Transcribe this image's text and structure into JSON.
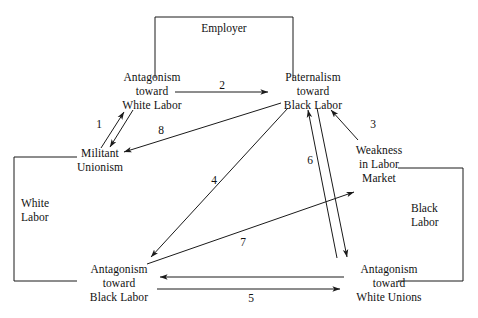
{
  "figure": {
    "type": "flow-diagram",
    "background": "#ffffff",
    "stroke_color": "#1a1a1a",
    "text_color": "#111111"
  },
  "brackets": [
    {
      "id": "employer",
      "label": "Employer",
      "orientation": "top-open-down"
    },
    {
      "id": "white-labor",
      "label_line1": "White",
      "label_line2": "Labor",
      "orientation": "left-open-right"
    },
    {
      "id": "black-labor",
      "label_line1": "Black",
      "label_line2": "Labor",
      "orientation": "right-open-left"
    }
  ],
  "nodes": [
    {
      "id": "antagonism-white-labor",
      "lines": [
        "Antagonism",
        "toward",
        "White Labor"
      ]
    },
    {
      "id": "paternalism-black-labor",
      "lines": [
        "Paternalism",
        "toward",
        "Black Labor"
      ]
    },
    {
      "id": "militant-unionism",
      "lines": [
        "Militant",
        "Unionism"
      ]
    },
    {
      "id": "weakness-labor-market",
      "lines": [
        "Weakness",
        "in Labor",
        "Market"
      ]
    },
    {
      "id": "antagonism-black-labor",
      "lines": [
        "Antagonism",
        "toward",
        "Black Labor"
      ]
    },
    {
      "id": "antagonism-white-unions",
      "lines": [
        "Antagonism",
        "toward",
        "White Unions"
      ]
    }
  ],
  "edges": [
    {
      "id": "edge-1",
      "label": "1",
      "from": "antagonism-white-labor",
      "to": "militant-unionism",
      "style": "bidirectional-pair"
    },
    {
      "id": "edge-2",
      "label": "2",
      "from": "antagonism-white-labor",
      "to": "paternalism-black-labor",
      "style": "single-arrow"
    },
    {
      "id": "edge-3",
      "label": "3",
      "from": "weakness-labor-market",
      "to": "paternalism-black-labor",
      "style": "single-arrow"
    },
    {
      "id": "edge-4",
      "label": "4",
      "from": "paternalism-black-labor",
      "to": "antagonism-black-labor",
      "style": "single-arrow"
    },
    {
      "id": "edge-5",
      "label": "5",
      "from": "antagonism-black-labor",
      "to": "antagonism-white-unions",
      "style": "bidirectional-pair"
    },
    {
      "id": "edge-6",
      "label": "6",
      "from": "antagonism-white-unions",
      "to": "paternalism-black-labor",
      "style": "bidirectional-pair"
    },
    {
      "id": "edge-7",
      "label": "7",
      "from": "antagonism-black-labor",
      "to": "weakness-labor-market",
      "style": "single-arrow"
    },
    {
      "id": "edge-8",
      "label": "8",
      "from": "paternalism-black-labor",
      "to": "militant-unionism",
      "style": "single-arrow"
    }
  ],
  "labels": {
    "employer": "Employer",
    "white_labor_l1": "White",
    "white_labor_l2": "Labor",
    "black_labor_l1": "Black",
    "black_labor_l2": "Labor",
    "n1_l1": "Antagonism",
    "n1_l2": "toward",
    "n1_l3": "White Labor",
    "n2_l1": "Paternalism",
    "n2_l2": "toward",
    "n2_l3": "Black Labor",
    "n3_l1": "Militant",
    "n3_l2": "Unionism",
    "n4_l1": "Weakness",
    "n4_l2": "in Labor",
    "n4_l3": "Market",
    "n5_l1": "Antagonism",
    "n5_l2": "toward",
    "n5_l3": "Black Labor",
    "n6_l1": "Antagonism",
    "n6_l2": "toward",
    "n6_l3": "White Unions",
    "e1": "1",
    "e2": "2",
    "e3": "3",
    "e4": "4",
    "e5": "5",
    "e6": "6",
    "e7": "7",
    "e8": "8"
  }
}
